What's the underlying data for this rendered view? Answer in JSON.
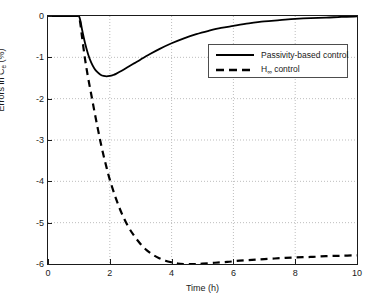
{
  "chart_data": {
    "type": "line",
    "title": "",
    "subtitle": "",
    "xlabel": "Time (h)",
    "ylabel_prefix": "Errors in C",
    "ylabel_sub": "e",
    "ylabel_suffix": " (%)",
    "ylabel": "Errors in C_e (%)",
    "xlim": [
      0,
      10
    ],
    "ylim": [
      -6,
      0
    ],
    "xticks": [
      "0",
      "2",
      "4",
      "6",
      "8",
      "10"
    ],
    "xtick_values": [
      0,
      2,
      4,
      6,
      8,
      10
    ],
    "yticks": [
      "0",
      "-1",
      "-2",
      "-3",
      "-4",
      "-5",
      "-6"
    ],
    "ytick_values": [
      0,
      -1,
      -2,
      -3,
      -4,
      -5,
      -6
    ],
    "grid": true,
    "grid_style": "dotted",
    "grid_color": "#bdbdbd",
    "legend_position": "upper right inside",
    "background": "#ffffff",
    "axis_color": "#1a1a1a",
    "series": [
      {
        "name": "Passivity-based control",
        "style": "solid",
        "color": "#000000",
        "width": 1.8,
        "x": [
          0,
          0.2,
          0.4,
          0.6,
          0.8,
          0.95,
          1.0,
          1.05,
          1.1,
          1.2,
          1.3,
          1.4,
          1.5,
          1.6,
          1.7,
          1.8,
          1.9,
          2.0,
          2.1,
          2.2,
          2.4,
          2.6,
          2.8,
          3.0,
          3.3,
          3.6,
          4.0,
          4.4,
          4.8,
          5.2,
          5.6,
          6.0,
          6.5,
          7.0,
          7.5,
          8.0,
          8.5,
          9.0,
          9.5,
          10.0
        ],
        "y": [
          0,
          0,
          0,
          0,
          0,
          0,
          0,
          -0.12,
          -0.32,
          -0.66,
          -0.93,
          -1.13,
          -1.27,
          -1.36,
          -1.42,
          -1.45,
          -1.46,
          -1.45,
          -1.43,
          -1.4,
          -1.32,
          -1.23,
          -1.14,
          -1.05,
          -0.92,
          -0.8,
          -0.66,
          -0.54,
          -0.44,
          -0.36,
          -0.29,
          -0.24,
          -0.18,
          -0.13,
          -0.1,
          -0.07,
          -0.05,
          -0.04,
          -0.02,
          -0.01
        ]
      },
      {
        "name": "H∞ control",
        "style": "dashed",
        "color": "#000000",
        "width": 2.2,
        "x": [
          0,
          0.2,
          0.4,
          0.6,
          0.8,
          0.95,
          1.0,
          1.05,
          1.1,
          1.2,
          1.3,
          1.4,
          1.5,
          1.6,
          1.7,
          1.8,
          1.9,
          2.0,
          2.2,
          2.4,
          2.6,
          2.8,
          3.0,
          3.2,
          3.4,
          3.6,
          3.8,
          4.0,
          4.2,
          4.4,
          4.6,
          4.8,
          5.0,
          5.4,
          5.8,
          6.2,
          6.6,
          7.0,
          7.5,
          8.0,
          8.5,
          9.0,
          9.5,
          10.0
        ],
        "y": [
          0,
          0,
          0,
          0,
          0,
          0,
          0,
          -0.2,
          -0.5,
          -1.05,
          -1.5,
          -1.9,
          -2.3,
          -2.68,
          -3.05,
          -3.38,
          -3.68,
          -3.96,
          -4.42,
          -4.8,
          -5.1,
          -5.33,
          -5.52,
          -5.67,
          -5.78,
          -5.86,
          -5.92,
          -5.96,
          -5.99,
          -6.0,
          -6.0,
          -6.0,
          -5.99,
          -5.97,
          -5.95,
          -5.92,
          -5.9,
          -5.88,
          -5.86,
          -5.84,
          -5.83,
          -5.81,
          -5.8,
          -5.79
        ]
      }
    ]
  },
  "legend": {
    "items": [
      {
        "label": "Passivity-based control",
        "style": "solid"
      },
      {
        "label_main": "H",
        "label_sub": "∞",
        "label_rest": " control",
        "label": "H∞ control",
        "style": "dashed"
      }
    ]
  }
}
